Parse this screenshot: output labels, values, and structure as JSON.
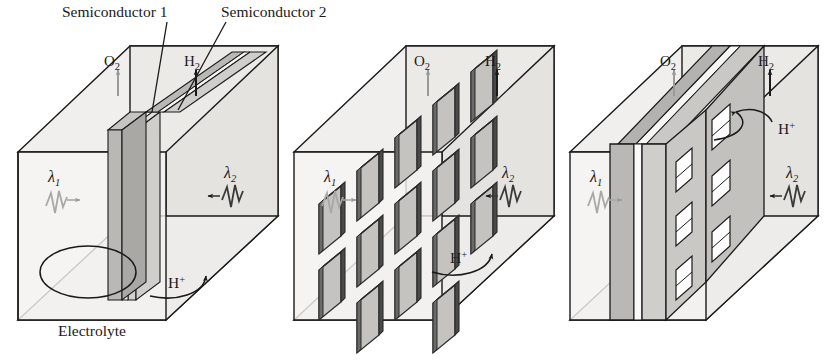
{
  "figure": {
    "domain": "scientific-diagram",
    "panel_count": 3,
    "callout_labels": [
      {
        "name": "semiconductor-1",
        "text": "Semiconductor 1",
        "x": 72,
        "y": 14
      },
      {
        "name": "semiconductor-2",
        "text": "Semiconductor 2",
        "x": 228,
        "y": 14
      }
    ],
    "electrolyte_label": {
      "text": "Electrolyte",
      "x": 60,
      "y": 330
    },
    "gas_labels": {
      "oxygen": "O",
      "oxygen_sub": "2",
      "hydrogen": "H",
      "hydrogen_sub": "2"
    },
    "ion_label": {
      "text": "H",
      "sup": "+"
    },
    "wavelength_labels": {
      "left": {
        "symbol": "λ",
        "sub": "1"
      },
      "right": {
        "symbol": "λ",
        "sub": "2"
      }
    },
    "colors": {
      "ink": "#1a1a1a",
      "box_face_light": "#f0efed",
      "box_face_mid": "#e4e3e0",
      "semiconductor_1": "#b9b8b5",
      "semiconductor_2": "#d2d1ce",
      "membrane": "#c9c8c5",
      "panel_fill": "#c4c3c0",
      "panel_edge": "#2b2b2b",
      "gray_arrow": "#9a9a98",
      "white": "#ffffff"
    },
    "panels": [
      {
        "id": "cell-1",
        "name": "solid-tandem-cell",
        "description": "Continuous planar tandem semiconductor assembly dividing the electrolyte chamber",
        "origin_x": 18,
        "features": [
          "O2 evolution",
          "H2 evolution",
          "lambda1 illumination",
          "lambda2 illumination",
          "H+ transport",
          "electrolyte circulation loop"
        ]
      },
      {
        "id": "cell-2",
        "name": "segmented-array-cell",
        "description": "Four-by-four array of discrete tandem panels suspended in the electrolyte",
        "origin_x": 294,
        "grid_rows": 4,
        "grid_cols": 4,
        "features": [
          "O2 evolution",
          "H2 evolution",
          "lambda1 illumination",
          "lambda2 illumination",
          "H+ transport"
        ]
      },
      {
        "id": "cell-3",
        "name": "perforated-membrane-cell",
        "description": "Tandem semiconductor membrane perforated with apertures for ion transport",
        "origin_x": 570,
        "hole_rows": 3,
        "hole_cols": 2,
        "features": [
          "O2 evolution",
          "H2 evolution",
          "lambda1 illumination",
          "lambda2 illumination",
          "H+ transport through perforations"
        ]
      }
    ]
  }
}
